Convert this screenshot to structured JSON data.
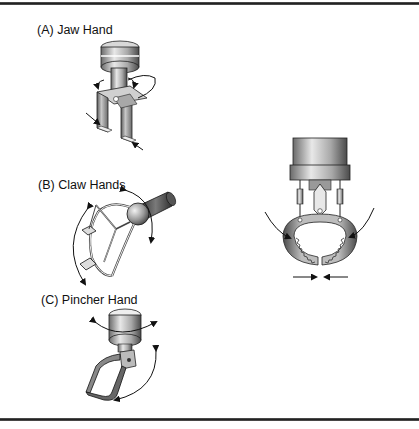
{
  "figure": {
    "panels": [
      {
        "id": "A",
        "label": "(A) Jaw Hand"
      },
      {
        "id": "B",
        "label": "(B) Claw Hands"
      },
      {
        "id": "C",
        "label": "(C) Pincher Hand"
      }
    ],
    "detail": {
      "description": "gripper with toothed circular jaws closing"
    }
  },
  "colors": {
    "rule": "#2a2a2a",
    "metal_dark": "#3a3a3a",
    "metal_mid": "#8a8a8a",
    "metal_light": "#e6e6e6",
    "line": "#111111"
  }
}
